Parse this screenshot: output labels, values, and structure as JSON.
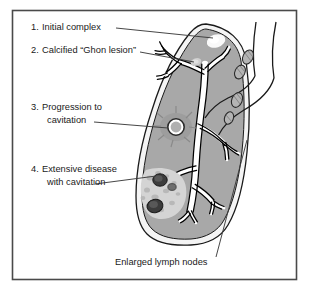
{
  "figure": {
    "kind": "medical-illustration",
    "frame_color": "#4a4a4a",
    "background_color": "#ffffff"
  },
  "colors": {
    "lung_fill": "#a8a8a8",
    "lung_outline": "#1a1a1a",
    "pleura_fill": "#f2f2f2",
    "bronchus_fill": "#ffffff",
    "bronchus_outline": "#000000",
    "lesion_white": "#f8f8f8",
    "lesion_faint": "#c9c9c9",
    "cavity_dark": "#3a3a3a",
    "consolidation": "#d8d8d8",
    "lymph_node_fill": "#b4b4b4",
    "leader_line": "#3c3c3c",
    "text": "#1a1a1a"
  },
  "labels": [
    {
      "id": "initial-complex",
      "number": "1.",
      "line1": "Initial complex",
      "line2": ""
    },
    {
      "id": "ghon-lesion",
      "number": "2.",
      "line1": "Calcified “Ghon lesion”",
      "line2": ""
    },
    {
      "id": "progression",
      "number": "3.",
      "line1": "Progression to",
      "line2": "cavitation"
    },
    {
      "id": "extensive-disease",
      "number": "4.",
      "line1": "Extensive disease",
      "line2": "with cavitation"
    }
  ],
  "bottom_label": {
    "id": "lymph-nodes",
    "text": "Enlarged lymph nodes"
  },
  "caption": {
    "text": ""
  },
  "anatomy": {
    "lung": "right lung sagittal section",
    "airway": "trachea and bronchial tree",
    "lymph_nodes_count": 4
  }
}
